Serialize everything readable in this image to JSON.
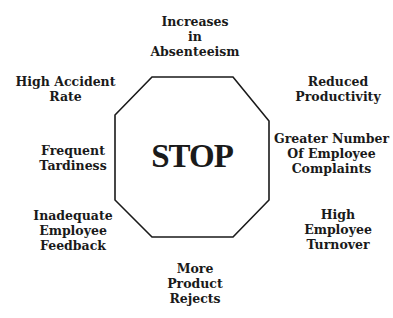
{
  "center": {
    "text": "STOP",
    "shape": "octagon"
  },
  "labels": {
    "top": "Increases\nin\nAbsenteeism",
    "top_right": "Reduced\nProductivity",
    "right": "Greater Number\nOf Employee\nComplaints",
    "bottom_right": "High\nEmployee\nTurnover",
    "bottom": "More\nProduct\nRejects",
    "bottom_left": "Inadequate\nEmployee\nFeedback",
    "left": "Frequent\nTardiness",
    "top_left": "High Accident\nRate"
  }
}
